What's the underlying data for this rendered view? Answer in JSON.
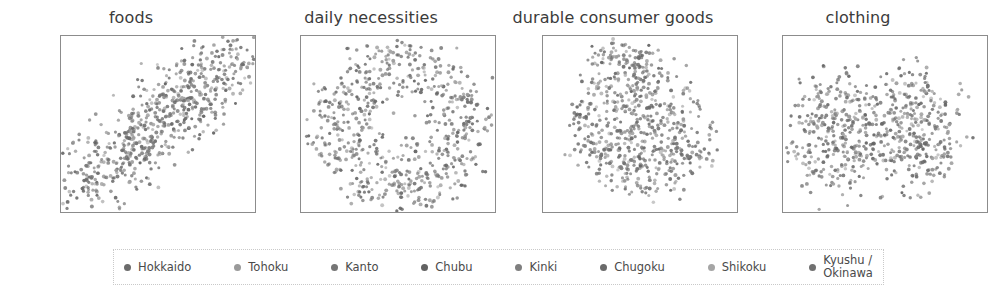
{
  "figure": {
    "width": 994,
    "height": 293,
    "background": "#ffffff"
  },
  "chart_data": {
    "type": "scatter",
    "title": "",
    "subtitle": "",
    "grid": false,
    "legend_position": "bottom",
    "xlabel": "",
    "ylabel": "",
    "xlim": [
      -32,
      30
    ],
    "ylim": [
      -22,
      23
    ],
    "xticks": [
      -20,
      0,
      20
    ],
    "yticks": [
      20,
      10,
      0,
      -10,
      -20
    ],
    "marker": "small-dot",
    "marker_color": "#6f6f6f",
    "panels": [
      {
        "title": "foods",
        "xticklabels": [
          "− 20",
          "0",
          "20"
        ],
        "yticklabels": [
          "20",
          "10",
          "0",
          "− 10",
          "− 20"
        ],
        "n_points": 640,
        "cluster_note": "diagonal elongated cloud rising left-bottom to right-top"
      },
      {
        "title": "daily necessities",
        "xticklabels": [
          "− 20",
          "0",
          "20"
        ],
        "yticklabels": [
          "20",
          "10",
          "0",
          "− 10",
          "− 20"
        ],
        "n_points": 640,
        "cluster_note": "broad roughly circular cloud filling axes"
      },
      {
        "title": "durable consumer goods",
        "xticklabels": [
          "− 20",
          "0",
          "20"
        ],
        "yticklabels": [
          "20",
          "10",
          "0",
          "− 10",
          "− 20"
        ],
        "n_points": 640,
        "cluster_note": "dense central blob with upper lobe near y=18"
      },
      {
        "title": "clothing",
        "xticklabels": [
          "− 20",
          "0",
          "20"
        ],
        "yticklabels": [
          "10",
          "0",
          "− 10",
          "− 20"
        ],
        "n_points": 640,
        "cluster_note": "broad cloud, slight vertical gap near x=-5"
      }
    ],
    "series": [
      {
        "name": "Hokkaido",
        "color": "#6b6b6b"
      },
      {
        "name": "Tohoku",
        "color": "#9a9a9a"
      },
      {
        "name": "Kanto",
        "color": "#757575"
      },
      {
        "name": "Chubu",
        "color": "#626262"
      },
      {
        "name": "Kinki",
        "color": "#7f7f7f"
      },
      {
        "name": "Chugoku",
        "color": "#6a6a6a"
      },
      {
        "name": "Shikoku",
        "color": "#a5a5a5"
      },
      {
        "name": "Kyushu /\nOkinawa",
        "color": "#707070"
      }
    ]
  },
  "legend": {
    "items": [
      {
        "label": "Hokkaido",
        "color": "#6b6b6b"
      },
      {
        "label": "Tohoku",
        "color": "#9a9a9a"
      },
      {
        "label": "Kanto",
        "color": "#757575"
      },
      {
        "label": "Chubu",
        "color": "#626262"
      },
      {
        "label": "Kinki",
        "color": "#7f7f7f"
      },
      {
        "label": "Chugoku",
        "color": "#6a6a6a"
      },
      {
        "label": "Shikoku",
        "color": "#a5a5a5"
      },
      {
        "label": "Kyushu /\nOkinawa",
        "color": "#707070"
      }
    ]
  }
}
